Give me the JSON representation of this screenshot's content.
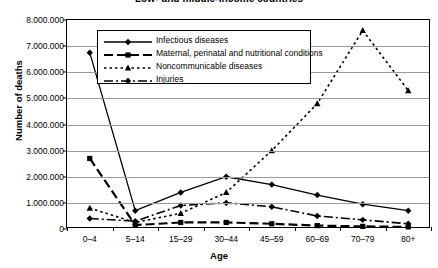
{
  "chart_data": {
    "type": "line",
    "title": "Low- and middle-income countries",
    "xlabel": "Age",
    "ylabel": "Number of deaths",
    "categories": [
      "0–4",
      "5–14",
      "15–29",
      "30–44",
      "45–59",
      "60–69",
      "70–79",
      "80+"
    ],
    "ylim": [
      0,
      8000000
    ],
    "ytick_step": 1000000,
    "ytick_labels": [
      "0",
      "1.000.000",
      "2.000.000",
      "3.000.000",
      "4.000.000",
      "5.000.000",
      "6.000.000",
      "7.000.000",
      "8.000.000"
    ],
    "grid": true,
    "legend_position": "upper-left-inside",
    "series": [
      {
        "name": "Infectious diseases",
        "marker": "diamond",
        "dash": "solid",
        "width": 1.3,
        "values": [
          6750000,
          700000,
          1400000,
          2000000,
          1700000,
          1300000,
          950000,
          700000
        ]
      },
      {
        "name": "Maternal, perinatal and nutritional conditions",
        "marker": "square",
        "dash": "dashed",
        "width": 2.2,
        "values": [
          2700000,
          150000,
          250000,
          250000,
          200000,
          130000,
          100000,
          80000
        ]
      },
      {
        "name": "Noncommunicable diseases",
        "marker": "triangle",
        "dash": "dotted",
        "width": 1.6,
        "values": [
          800000,
          250000,
          600000,
          1400000,
          3000000,
          4800000,
          7600000,
          5300000
        ]
      },
      {
        "name": "Injuries",
        "marker": "diamond",
        "dash": "dashdot",
        "width": 1.6,
        "values": [
          400000,
          300000,
          900000,
          1000000,
          850000,
          500000,
          350000,
          200000
        ]
      }
    ]
  }
}
